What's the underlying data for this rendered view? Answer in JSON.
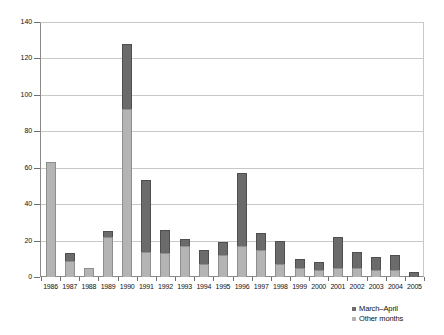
{
  "chart_data": {
    "type": "bar",
    "stacked": true,
    "title": "",
    "xlabel": "",
    "ylabel": "",
    "ylim": [
      0,
      140
    ],
    "ytick_step": 20,
    "yticks": [
      0,
      20,
      40,
      60,
      80,
      100,
      120,
      140
    ],
    "grid": true,
    "legend_position": "bottom-right",
    "categories": [
      "1986",
      "1987",
      "1988",
      "1989",
      "1990",
      "1991",
      "1992",
      "1993",
      "1994",
      "1995",
      "1996",
      "1997",
      "1998",
      "1999",
      "2000",
      "2001",
      "2002",
      "2003",
      "2004",
      "2005"
    ],
    "series": [
      {
        "name": "Other months",
        "color": "#b4b4b4",
        "values": [
          63,
          9,
          5,
          22,
          92,
          14,
          13,
          17,
          7,
          12,
          17,
          15,
          7,
          5,
          4,
          5,
          5,
          4,
          4,
          0
        ]
      },
      {
        "name": "March-April",
        "color": "#6b6b6b",
        "values": [
          0,
          4,
          0,
          3,
          36,
          39,
          13,
          4,
          8,
          7,
          40,
          9,
          13,
          5,
          4,
          17,
          9,
          7,
          8,
          3
        ]
      }
    ],
    "totals": [
      63,
      13,
      5,
      25,
      128,
      53,
      26,
      21,
      15,
      19,
      57,
      24,
      20,
      10,
      8,
      22,
      14,
      11,
      12,
      3
    ]
  },
  "legend": {
    "items": [
      {
        "label": "March–April",
        "swatch": "dark"
      },
      {
        "label": "Other months",
        "swatch": "light"
      }
    ]
  }
}
